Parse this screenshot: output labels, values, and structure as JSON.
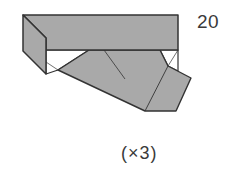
{
  "diagram": {
    "type": "origami-step",
    "step_number": "20",
    "repeat_note": "(×3)",
    "colors": {
      "paper_fill": "#a9a9a9",
      "outline": "#333333",
      "background": "#ffffff",
      "text": "#3a3a3a"
    }
  }
}
